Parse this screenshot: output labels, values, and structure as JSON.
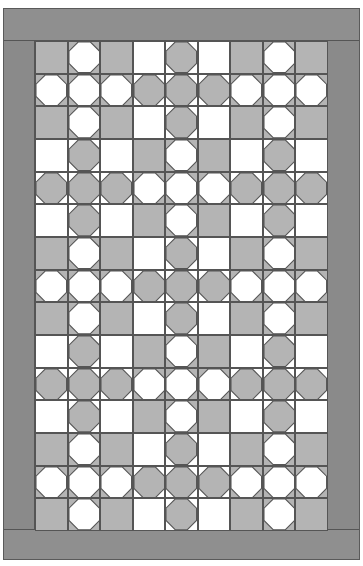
{
  "quilt": {
    "title": "Snowball quilt pattern",
    "columns": 9,
    "rows": 15,
    "block_size": 3,
    "block_layout": [
      [
        "A",
        "B",
        "A"
      ],
      [
        "B",
        "A",
        "B"
      ],
      [
        "A",
        "B",
        "A"
      ],
      [
        "B",
        "A",
        "B"
      ],
      [
        "A",
        "B",
        "A"
      ]
    ],
    "block_templates": {
      "A": [
        [
          "plain-gray",
          "octagon-white",
          "plain-gray"
        ],
        [
          "octagon-white",
          "octagon-white",
          "octagon-white"
        ],
        [
          "plain-gray",
          "octagon-white",
          "plain-gray"
        ]
      ],
      "B": [
        [
          "plain-white",
          "octagon-gray",
          "plain-white"
        ],
        [
          "octagon-gray",
          "octagon-gray",
          "octagon-gray"
        ],
        [
          "plain-white",
          "octagon-gray",
          "plain-white"
        ]
      ]
    },
    "colors": {
      "border": "#8d8d8d",
      "gray": "#b4b4b4",
      "white": "#ffffff",
      "line": "#555555"
    }
  }
}
